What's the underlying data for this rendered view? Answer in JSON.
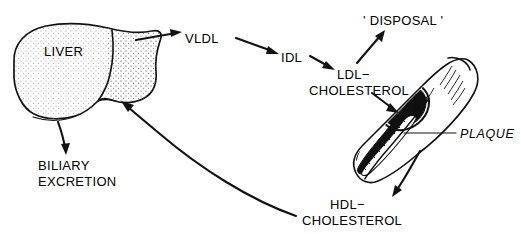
{
  "diagram": {
    "nodes": {
      "liver": "LIVER",
      "vldl": "VLDL",
      "idl": "IDL",
      "ldl_line1": "LDL−",
      "ldl_line2": "CHOLESTEROL",
      "disposal": "' DISPOSAL '",
      "plaque": "PLAQUE",
      "biliary_line1": "BILIARY",
      "biliary_line2": "EXCRETION",
      "hdl_line1": "HDL−",
      "hdl_line2": "CHOLESTEROL"
    },
    "colors": {
      "ink": "#111111",
      "paper": "#ffffff",
      "organ_shade": "#8a8a8a",
      "lumen": "#101010"
    },
    "arrows": [
      {
        "name": "liver-to-vldl",
        "from": "LIVER",
        "to": "VLDL"
      },
      {
        "name": "vldl-to-idl",
        "from": "VLDL",
        "to": "IDL"
      },
      {
        "name": "idl-to-ldl",
        "from": "IDL",
        "to": "LDL−CHOLESTEROL"
      },
      {
        "name": "ldl-to-disposal",
        "from": "LDL−CHOLESTEROL",
        "to": "' DISPOSAL '"
      },
      {
        "name": "ldl-to-artery",
        "from": "LDL−CHOLESTEROL",
        "to": "ARTERY PLAQUE"
      },
      {
        "name": "artery-to-hdl",
        "from": "ARTERY PLAQUE",
        "to": "HDL−CHOLESTEROL"
      },
      {
        "name": "hdl-to-liver",
        "from": "HDL−CHOLESTEROL",
        "to": "LIVER"
      },
      {
        "name": "liver-to-biliary",
        "from": "LIVER",
        "to": "BILIARY EXCRETION"
      },
      {
        "name": "return-to-liver",
        "from": "HDL−CHOLESTEROL",
        "to": "LIVER"
      }
    ]
  }
}
